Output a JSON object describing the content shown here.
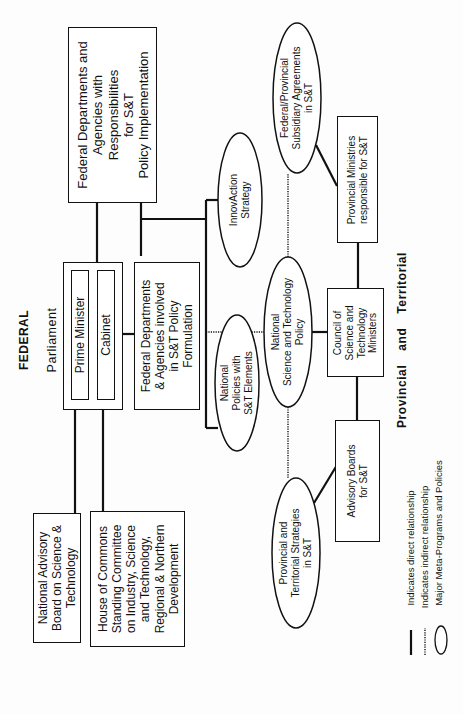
{
  "diagram": {
    "orientation": "rotated-90-ccw",
    "sections": {
      "federal_heading": "FEDERAL",
      "parliament_label": "Parliament",
      "provincial_heading": "Provincial and Territorial"
    },
    "boxes": {
      "fed_implementation": [
        "Federal Departments and",
        "Agencies with",
        "Responsibilities",
        "for S&T",
        "Policy Implementation"
      ],
      "prime_minister": "Prime Minister",
      "cabinet": "Cabinet",
      "fed_formulation": [
        "Federal Departments",
        "& Agencies involved",
        "in S&T Policy",
        "Formulation"
      ],
      "national_advisory_board": [
        "National Advisory",
        "Board on Science &",
        "Technology"
      ],
      "house_of_commons": [
        "House of Commons",
        "Standing Committee",
        "on Industry, Science",
        "and Technology,",
        "Regional & Northern",
        "Development"
      ],
      "provincial_ministries": [
        "Provincial Ministries",
        "responsible for S&T"
      ],
      "council": [
        "Council of",
        "Science and",
        "Technology",
        "Ministers"
      ],
      "advisory_boards": [
        "Advisory Boards",
        "for S&T"
      ]
    },
    "ellipses": {
      "innovaction": [
        "InnovAction",
        "Strategy"
      ],
      "fed_prov_agreements": [
        "Federal/Provincial",
        "Subsidiary Agreements",
        "in S&T"
      ],
      "national_st_policy": [
        "National",
        "Science and Technology",
        "Policy"
      ],
      "national_policies": [
        "National",
        "Policies with",
        "S&T Elements"
      ],
      "prov_terr_strategies": [
        "Provincial and",
        "Territorial Strategies",
        "in S&T"
      ]
    },
    "legend": {
      "direct": "Indicates direct relationship",
      "indirect": "Indicates indirect relationship",
      "meta": "Major Meta-Programs and Policies"
    },
    "colors": {
      "line": "#111111",
      "background": "#fdfdfd"
    }
  }
}
